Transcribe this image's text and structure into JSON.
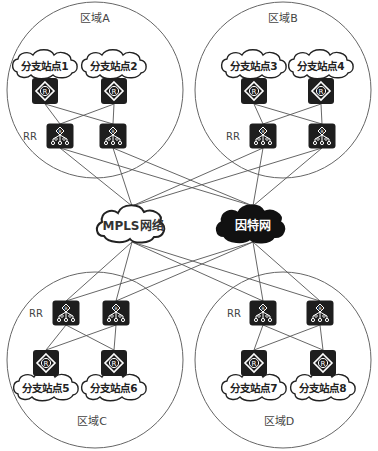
{
  "diagram": {
    "regions": [
      {
        "id": "A",
        "label": "区域A",
        "sites": [
          {
            "label": "分支站点1"
          },
          {
            "label": "分支站点2"
          }
        ],
        "rr_label": "RR"
      },
      {
        "id": "B",
        "label": "区域B",
        "sites": [
          {
            "label": "分支站点3"
          },
          {
            "label": "分支站点4"
          }
        ],
        "rr_label": "RR"
      },
      {
        "id": "C",
        "label": "区域C",
        "sites": [
          {
            "label": "分支站点5"
          },
          {
            "label": "分支站点6"
          }
        ],
        "rr_label": "RR"
      },
      {
        "id": "D",
        "label": "区域D",
        "sites": [
          {
            "label": "分支站点7"
          },
          {
            "label": "分支站点8"
          }
        ],
        "rr_label": "RR"
      }
    ],
    "networks": [
      {
        "id": "mpls",
        "label": "MPLS网络",
        "style": "outline"
      },
      {
        "id": "internet",
        "label": "因特网",
        "style": "filled"
      }
    ],
    "router_glyph": "R",
    "colors": {
      "device_fill": "#1e1e1e",
      "line": "#555555",
      "text": "#333333"
    }
  }
}
